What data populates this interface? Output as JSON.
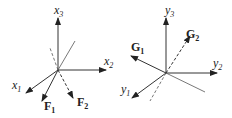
{
  "diagrams": [
    {
      "name": "left-frame",
      "axes": [
        {
          "label": "x",
          "sub": "3"
        },
        {
          "label": "x",
          "sub": "2"
        },
        {
          "label": "x",
          "sub": "1"
        }
      ],
      "vectors": [
        {
          "label": "F",
          "sub": "1",
          "style": "solid"
        },
        {
          "label": "F",
          "sub": "2",
          "style": "dashed"
        }
      ]
    },
    {
      "name": "right-frame",
      "axes": [
        {
          "label": "y",
          "sub": "3"
        },
        {
          "label": "y",
          "sub": "2"
        },
        {
          "label": "y",
          "sub": "1"
        }
      ],
      "vectors": [
        {
          "label": "G",
          "sub": "1",
          "style": "solid"
        },
        {
          "label": "G",
          "sub": "2",
          "style": "dashed"
        }
      ]
    }
  ],
  "colors": {
    "line": "#333333",
    "text": "#222222"
  }
}
